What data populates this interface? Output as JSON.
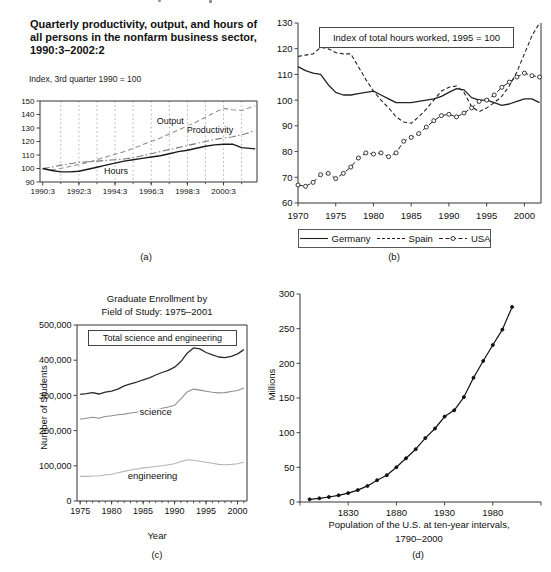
{
  "figure": {
    "charts": {
      "a": {
        "title_lines": [
          "Quarterly productivity, output, and hours of",
          "all persons in the nonfarm business sector,",
          "1990:3–2002:2"
        ],
        "subtitle": "Index, 3rd quarter 1990 = 100",
        "caption": "(a)"
      },
      "b": {
        "box_title": "Index of total hours worked, 1995 = 100",
        "caption": "(b)",
        "legend": [
          {
            "label": "Germany"
          },
          {
            "label": "Spain"
          },
          {
            "label": "USA"
          }
        ]
      },
      "c": {
        "title_lines": [
          "Graduate Enrollment by",
          "Field of Study: 1975–2001"
        ],
        "box_label": "Total science and engineering",
        "ylabel": "Number of Students",
        "xlabel": "Year",
        "caption": "(c)"
      },
      "d": {
        "ylabel": "Millions",
        "caption_lines": [
          "Population of the U.S. at ten-year intervals,",
          "1790–2000"
        ],
        "caption": "(d)"
      }
    }
  },
  "chart_data": [
    {
      "id": "a",
      "type": "line",
      "title": "Quarterly productivity, output, and hours of all persons in the nonfarm business sector, 1990:3–2002:2",
      "ylabel": "Index, 3rd quarter 1990 = 100",
      "xlim": [
        1990.6,
        2002.6
      ],
      "ylim": [
        90,
        150
      ],
      "grid": "vertical dashed lines at each year 1991:3–2001:3",
      "x": [
        1990.75,
        1991.25,
        1991.75,
        1992.25,
        1992.75,
        1993.25,
        1993.75,
        1994.25,
        1994.75,
        1995.25,
        1995.75,
        1996.25,
        1996.75,
        1997.25,
        1997.75,
        1998.25,
        1998.75,
        1999.25,
        1999.75,
        2000.25,
        2000.75,
        2001.25,
        2001.75,
        2002.5
      ],
      "series": [
        {
          "name": "Output",
          "values": [
            100,
            99,
            100,
            101.5,
            103,
            104.5,
            106.5,
            108.5,
            110.5,
            112.5,
            115,
            117.5,
            120,
            122.5,
            125.5,
            128.5,
            131.5,
            134.5,
            138,
            141.5,
            144.5,
            143.5,
            143,
            146.5
          ]
        },
        {
          "name": "Productivity",
          "values": [
            100,
            101,
            102.5,
            103.5,
            104.5,
            105,
            105.5,
            106,
            106.5,
            107,
            108,
            109.5,
            111,
            112.5,
            114,
            115.5,
            117,
            118.5,
            120,
            121.5,
            122.5,
            123.5,
            125,
            128
          ]
        },
        {
          "name": "Hours",
          "values": [
            100,
            98.5,
            97.5,
            97.5,
            98,
            99.5,
            101,
            102.5,
            104,
            105.5,
            106.5,
            107.5,
            108.5,
            109.5,
            111,
            112.5,
            113.5,
            115,
            116.5,
            117.5,
            118,
            118,
            115.5,
            114.5
          ]
        }
      ],
      "xticks": {
        "values": [
          1990.75,
          1992.75,
          1994.75,
          1996.75,
          1998.75,
          2000.75
        ],
        "labels": [
          "1990:3",
          "1992:3",
          "1994:3",
          "1996:3",
          "1998:3",
          "2000:3"
        ]
      },
      "yticks": {
        "values": [
          90,
          100,
          110,
          120,
          130,
          140,
          150
        ],
        "labels": [
          "90",
          "100",
          "110",
          "120",
          "130",
          "140",
          "150"
        ]
      },
      "annotations": [
        {
          "text": "Output",
          "x": 1997.8,
          "y": 133
        },
        {
          "text": "Productivity",
          "x": 2000.0,
          "y": 126.5
        },
        {
          "text": "Hours",
          "x": 1994.8,
          "y": 96.2
        }
      ]
    },
    {
      "id": "b",
      "type": "line",
      "title": "Index of total hours worked, 1995 = 100",
      "xlim": [
        1970,
        2002.2
      ],
      "ylim": [
        60,
        130
      ],
      "grid": "off",
      "legend_position": "bottom",
      "x": [
        1970,
        1971,
        1972,
        1973,
        1974,
        1975,
        1976,
        1977,
        1978,
        1979,
        1980,
        1981,
        1982,
        1983,
        1984,
        1985,
        1986,
        1987,
        1988,
        1989,
        1990,
        1991,
        1992,
        1993,
        1994,
        1995,
        1996,
        1997,
        1998,
        1999,
        2000,
        2001,
        2002
      ],
      "series": [
        {
          "name": "Germany",
          "values": [
            113,
            111.5,
            110.5,
            110,
            106,
            103,
            102,
            102,
            102.5,
            103,
            103.5,
            102,
            100.5,
            99,
            99,
            99,
            99.5,
            100,
            100.5,
            101.5,
            103,
            104.5,
            104,
            101,
            100,
            100,
            99,
            98,
            98.5,
            99.5,
            100.5,
            100.5,
            99
          ]
        },
        {
          "name": "Spain",
          "values": [
            117,
            117.5,
            118,
            120.5,
            120,
            118.5,
            118,
            118,
            113,
            108,
            103.5,
            100,
            97,
            93.5,
            91.5,
            91,
            93.5,
            96.5,
            100,
            103.5,
            105,
            105.5,
            103,
            97.5,
            95.5,
            97,
            99,
            101.5,
            105.5,
            111,
            118,
            125,
            130
          ]
        },
        {
          "name": "USA",
          "values": [
            67,
            66.5,
            68,
            71,
            71.5,
            69.5,
            71.5,
            74,
            77.5,
            79.5,
            79,
            79.5,
            78,
            79.5,
            84,
            85.5,
            87,
            89.5,
            92,
            94,
            94.5,
            93.5,
            95,
            97,
            99.5,
            100,
            102,
            105,
            107,
            109,
            110.5,
            109.5,
            109
          ]
        }
      ],
      "xticks": {
        "values": [
          1970,
          1975,
          1980,
          1985,
          1990,
          1995,
          2000
        ],
        "labels": [
          "1970",
          "1975",
          "1980",
          "1985",
          "1990",
          "1995",
          "2000"
        ]
      },
      "yticks": {
        "values": [
          60,
          70,
          80,
          90,
          100,
          110,
          120,
          130
        ],
        "labels": [
          "60",
          "70",
          "80",
          "90",
          "100",
          "110",
          "120",
          "130"
        ]
      },
      "annotations": []
    },
    {
      "id": "c",
      "type": "line",
      "title": "Graduate Enrollment by Field of Study: 1975–2001",
      "xlabel": "Year",
      "ylabel": "Number of Students",
      "xlim": [
        1974.5,
        2001.5
      ],
      "ylim": [
        0,
        500000
      ],
      "grid": "off",
      "x": [
        1975,
        1976,
        1977,
        1978,
        1979,
        1980,
        1981,
        1982,
        1983,
        1984,
        1985,
        1986,
        1987,
        1988,
        1989,
        1990,
        1991,
        1992,
        1993,
        1994,
        1995,
        1996,
        1997,
        1998,
        1999,
        2000,
        2001
      ],
      "series": [
        {
          "name": "Total science and engineering",
          "values": [
            303000,
            305000,
            308000,
            304000,
            309000,
            312000,
            318000,
            327000,
            333000,
            338000,
            344000,
            350000,
            358000,
            365000,
            371000,
            380000,
            396000,
            420000,
            435000,
            432000,
            422000,
            415000,
            409000,
            407000,
            411000,
            418000,
            430000
          ]
        },
        {
          "name": "science",
          "values": [
            232000,
            235000,
            238000,
            235000,
            240000,
            242000,
            245000,
            247000,
            250000,
            252000,
            255000,
            257000,
            260000,
            263000,
            267000,
            272000,
            290000,
            310000,
            318000,
            315000,
            312000,
            309000,
            307000,
            308000,
            311000,
            314000,
            321000
          ]
        },
        {
          "name": "engineering",
          "values": [
            70000,
            70000,
            71000,
            72000,
            74000,
            76000,
            80000,
            84000,
            88000,
            91000,
            94000,
            96000,
            98000,
            100000,
            103000,
            106000,
            112000,
            117000,
            116000,
            113000,
            110000,
            107000,
            104000,
            103000,
            104000,
            106000,
            110000
          ]
        }
      ],
      "xticks": {
        "values": [
          1975,
          1980,
          1985,
          1990,
          1995,
          2000
        ],
        "labels": [
          "1975",
          "1980",
          "1985",
          "1990",
          "1995",
          "2000"
        ]
      },
      "yticks": {
        "values": [
          0,
          100000,
          200000,
          300000,
          400000,
          500000
        ],
        "labels": [
          "0",
          "100,000",
          "200,000",
          "300,000",
          "400,000",
          "500,000"
        ]
      },
      "annotations": [
        {
          "text": "science",
          "x": 1987,
          "y": 243000
        },
        {
          "text": "engineering",
          "x": 1986.5,
          "y": 63000
        }
      ]
    },
    {
      "id": "d",
      "type": "line",
      "title": "Population of the U.S. at ten-year intervals, 1790–2000",
      "ylabel": "Millions",
      "xlim": [
        1780,
        2030
      ],
      "ylim": [
        0,
        300
      ],
      "grid": "off",
      "x": [
        1790,
        1800,
        1810,
        1820,
        1830,
        1840,
        1850,
        1860,
        1870,
        1880,
        1890,
        1900,
        1910,
        1920,
        1930,
        1940,
        1950,
        1960,
        1970,
        1980,
        1990,
        2000
      ],
      "series": [
        {
          "name": "U.S. population",
          "values": [
            3.9,
            5.3,
            7.2,
            9.6,
            12.9,
            17.1,
            23.2,
            31.4,
            38.6,
            50.2,
            63.0,
            76.2,
            92.2,
            106.0,
            123.2,
            132.2,
            151.3,
            179.3,
            203.3,
            226.5,
            248.7,
            281.4
          ]
        }
      ],
      "xticks": {
        "values": [
          1780,
          1830,
          1880,
          1930,
          1980,
          2030
        ],
        "labels": [
          "",
          "1830",
          "1880",
          "1930",
          "1980",
          ""
        ]
      },
      "yticks": {
        "values": [
          0,
          50,
          100,
          150,
          200,
          250,
          300
        ],
        "labels": [
          "0",
          "50",
          "100",
          "150",
          "200",
          "250",
          "300"
        ]
      },
      "annotations": []
    }
  ],
  "render": {
    "charts": [
      {
        "data": 0,
        "plot": {
          "x0": 25,
          "x1": 242,
          "y0": 11,
          "y1": 92
        },
        "spines": [
          "top",
          "right",
          "bottom",
          "left"
        ],
        "fs": 8,
        "afs": 9,
        "xlabdy": 11.5,
        "xgrid": [
          1991.75,
          1992.75,
          1993.75,
          1994.75,
          1995.75,
          1996.75,
          1997.75,
          1998.75,
          1999.75,
          2000.75,
          2001.75
        ],
        "minorx": [
          1991.75,
          1992.75,
          1993.75,
          1994.75,
          1995.75,
          1996.75,
          1997.75,
          1998.75,
          1999.75,
          2000.75,
          2001.75
        ],
        "styles": [
          {
            "color": "#8f8f8f",
            "w": 1.1,
            "dash": "5,3"
          },
          {
            "color": "#7a7a7a",
            "w": 1.1,
            "dash": "7,2.5,1.5,2.5"
          },
          {
            "color": "#1a1a1a",
            "w": 1.4
          }
        ]
      },
      {
        "data": 1,
        "plot": {
          "x0": 23,
          "x1": 266,
          "y0": 11,
          "y1": 191
        },
        "spines": [
          "left",
          "bottom",
          "right"
        ],
        "fs": 9.5,
        "afs": 9.5,
        "xlabdy": 16,
        "styles": [
          {
            "color": "#222222",
            "w": 1.3
          },
          {
            "color": "#222222",
            "w": 1.1,
            "dash": "4,2.5"
          },
          {
            "color": "#222222",
            "w": 1.0,
            "dash": "5,3",
            "marker": {
              "r": 2,
              "fill": "#ffffff"
            }
          }
        ]
      },
      {
        "data": 2,
        "plot": {
          "x0": 22,
          "x1": 192,
          "y0": 7,
          "y1": 183
        },
        "spines": [
          "top",
          "right",
          "bottom",
          "left"
        ],
        "fs": 9,
        "afs": 9.5,
        "xlabdy": 13,
        "minorx": [
          1975,
          1976,
          1977,
          1978,
          1979,
          1980,
          1981,
          1982,
          1983,
          1984,
          1985,
          1986,
          1987,
          1988,
          1989,
          1990,
          1991,
          1992,
          1993,
          1994,
          1995,
          1996,
          1997,
          1998,
          1999,
          2000,
          2001
        ],
        "styles": [
          {
            "color": "#2b2b2b",
            "w": 1.3
          },
          {
            "color": "#8f8f8f",
            "w": 1.1
          },
          {
            "color": "#b5b5b5",
            "w": 1.1
          }
        ]
      },
      {
        "data": 3,
        "plot": {
          "x0": 25,
          "x1": 266,
          "y0": 6,
          "y1": 214
        },
        "spines": [
          "left",
          "bottom"
        ],
        "fs": 9.5,
        "afs": 9.5,
        "xlabdy": 13.5,
        "styles": [
          {
            "color": "#111111",
            "w": 1.2,
            "marker": {
              "r": 1.5,
              "fill": "#111111"
            }
          }
        ]
      }
    ],
    "legend_samples": [
      {
        "dash": null,
        "marker": false
      },
      {
        "dash": "3,2",
        "marker": false
      },
      {
        "dash": "4,2.5",
        "marker": true
      }
    ],
    "colors": {
      "ink": "#111111",
      "axis": "#333333",
      "grid": "#9a9a9a"
    }
  }
}
